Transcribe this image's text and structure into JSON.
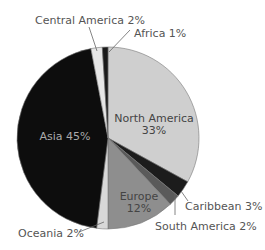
{
  "chart_data": {
    "type": "pie",
    "title": "",
    "slices": [
      {
        "label": "North America",
        "value": 33,
        "display": "North America 33%",
        "color": "#cfcfcf"
      },
      {
        "label": "Caribbean",
        "value": 3,
        "display": "Caribbean 3%",
        "color": "#1c1c1c"
      },
      {
        "label": "South America",
        "value": 2,
        "display": "South America 2%",
        "color": "#5a5a5a"
      },
      {
        "label": "Europe",
        "value": 12,
        "display": "Europe 12%",
        "color": "#8e8e8e"
      },
      {
        "label": "Oceania",
        "value": 2,
        "display": "Oceania 2%",
        "color": "#d8d8d8"
      },
      {
        "label": "Asia",
        "value": 45,
        "display": "Asia 45%",
        "color": "#0d0d0d"
      },
      {
        "label": "Central America",
        "value": 2,
        "display": "Central America 2%",
        "color": "#e6e6e6"
      },
      {
        "label": "Africa",
        "value": 1,
        "display": "Africa 1%",
        "color": "#1a1a1a"
      }
    ],
    "labels": {
      "north_america_name": "North America",
      "north_america_pct": "33%",
      "asia": "Asia 45%",
      "europe_name": "Europe",
      "europe_pct": "12%",
      "caribbean": "Caribbean 3%",
      "south_america": "South America 2%",
      "oceania": "Oceania 2%",
      "central_america": "Central America 2%",
      "africa": "Africa 1%"
    },
    "legend": "none",
    "start_angle": "12 o'clock, clockwise"
  }
}
